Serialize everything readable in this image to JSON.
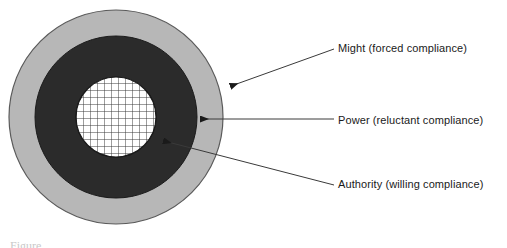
{
  "figure": {
    "type": "concentric-rings",
    "title": "",
    "caption_fragment": "Figure"
  },
  "rings": [
    {
      "id": "outer",
      "name": "Might",
      "label": "Might (forced compliance)",
      "compliance": "forced compliance",
      "fill": "#b7b7b7",
      "stroke": "#4a4a4a",
      "radius": 107,
      "order": 3
    },
    {
      "id": "middle",
      "name": "Power",
      "label": "Power (reluctant compliance)",
      "compliance": "reluctant compliance",
      "fill": "#2b2b2b",
      "stroke": "#1a1a1a",
      "radius": 81,
      "order": 2
    },
    {
      "id": "inner",
      "name": "Authority",
      "label": "Authority (willing compliance)",
      "compliance": "willing compliance",
      "fill": "#ffffff",
      "stroke": "#1a1a1a",
      "pattern": "crosshatch-grid",
      "grid_spacing": 7,
      "radius": 40,
      "order": 1
    }
  ],
  "geometry": {
    "center_x": 116,
    "center_y": 117,
    "outer_radius": 107,
    "middle_radius": 81,
    "inner_radius": 40
  },
  "callouts": [
    {
      "id": "might",
      "text": "Might (forced compliance)",
      "target_ring": "outer",
      "tip_x": 231,
      "tip_y": 86,
      "tail_x": 334,
      "tail_y": 49
    },
    {
      "id": "power",
      "text": "Power (reluctant compliance)",
      "target_ring": "middle",
      "tip_x": 201,
      "tip_y": 119,
      "tail_x": 334,
      "tail_y": 119
    },
    {
      "id": "authority",
      "text": "Authority (willing compliance)",
      "target_ring": "inner",
      "tip_x": 164,
      "tip_y": 141,
      "tail_x": 334,
      "tail_y": 185
    }
  ],
  "colors": {
    "background": "#ffffff",
    "outer_ring": "#b7b7b7",
    "middle_ring": "#2b2b2b",
    "inner_fill": "#ffffff",
    "grid_line": "#3a3a3a",
    "leader_line": "#3a3a3a",
    "text": "#1a1a1a"
  }
}
